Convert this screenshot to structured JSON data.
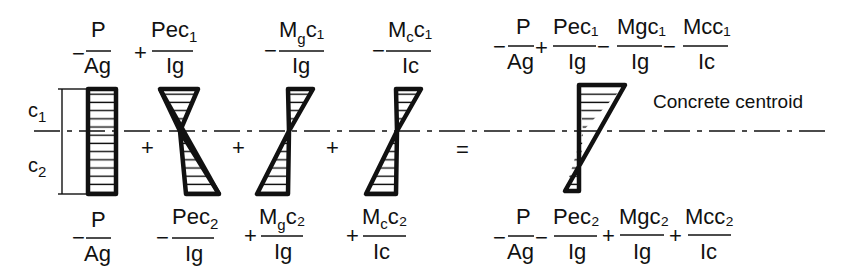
{
  "diagram": {
    "centroid_label": "Concrete centroid",
    "dimension_labels": {
      "top": "c",
      "top_sub": "1",
      "bottom": "c",
      "bottom_sub": "2"
    },
    "operators_between_diagrams": [
      "+",
      "+",
      "+",
      "="
    ],
    "colors": {
      "ink": "#111111",
      "background": "#ffffff"
    },
    "terms": [
      {
        "id": "axial",
        "shape": "rectangle",
        "top": {
          "sign": "−",
          "num": "P",
          "num_sub": "",
          "num_tail": "",
          "den": "Ag"
        },
        "bottom": {
          "sign": "−",
          "num": "P",
          "num_sub": "",
          "num_tail": "",
          "den": "Ag"
        }
      },
      {
        "id": "prestress-eccentricity",
        "shape": "bowtie-top-left-bottom-right",
        "top": {
          "sign": "+",
          "num": "Pec",
          "num_sub": "1",
          "num_tail": "",
          "den": "Ig"
        },
        "bottom": {
          "sign": "−",
          "num": "Pec",
          "num_sub": "2",
          "num_tail": "",
          "den": "Ig"
        }
      },
      {
        "id": "girder-moment",
        "shape": "bowtie-top-right-bottom-left",
        "top": {
          "sign": "−",
          "num": "M",
          "num_sub": "g",
          "num_tail": "c₁",
          "den": "Ig"
        },
        "bottom": {
          "sign": "+",
          "num": "M",
          "num_sub": "g",
          "num_tail": "c₂",
          "den": "Ig"
        }
      },
      {
        "id": "composite-moment",
        "shape": "bowtie-top-right-bottom-left",
        "top": {
          "sign": "−",
          "num": "M",
          "num_sub": "c",
          "num_tail": "c₁",
          "den": "Ic"
        },
        "bottom": {
          "sign": "+",
          "num": "M",
          "num_sub": "c",
          "num_tail": "c₂",
          "den": "Ic"
        }
      }
    ],
    "result": {
      "shape": "resultant-large-top-small-bottom",
      "top": [
        {
          "sign": "−",
          "num": "P",
          "den": "Ag"
        },
        {
          "sign": "+",
          "num": "Pec₁",
          "den": "Ig"
        },
        {
          "sign": "−",
          "num": "Mgc₁",
          "den": "Ig"
        },
        {
          "sign": "−",
          "num": "Mcc₁",
          "den": "Ic"
        }
      ],
      "bottom": [
        {
          "sign": "−",
          "num": "P",
          "den": "Ag"
        },
        {
          "sign": "−",
          "num": "Pec₂",
          "den": "Ig"
        },
        {
          "sign": "+",
          "num": "Mgc₂",
          "den": "Ig"
        },
        {
          "sign": "+",
          "num": "Mcc₂",
          "den": "Ic"
        }
      ]
    }
  }
}
